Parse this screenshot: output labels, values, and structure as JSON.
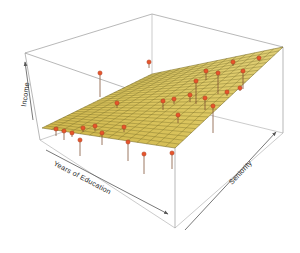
{
  "figure": {
    "name": "3d-regression-plane",
    "background_color": "#ffffff",
    "axes": {
      "vertical": {
        "label": "Income",
        "name": "income-axis"
      },
      "left_horizontal": {
        "label": "Years of Education",
        "name": "years-of-education-axis"
      },
      "right_horizontal": {
        "label": "Seniority",
        "name": "seniority-axis"
      }
    },
    "colors": {
      "plane_fill": "#d8c152",
      "plane_fill_light": "#e3d27a",
      "plane_fill_dark": "#b9a342",
      "mesh_line": "#6f6524",
      "point": "#e8542a",
      "point_stroke": "#a8361a",
      "residual_line": "#7a4a2f",
      "box_line": "#8d8d8d",
      "label_text": "#2b2b2b"
    }
  },
  "chart_data": {
    "type": "scatter",
    "title": "",
    "subtitle": "",
    "xlabel": "Years of Education",
    "ylabel": "Seniority",
    "zlabel": "Income",
    "grid": false,
    "legend_position": "none",
    "surface": {
      "name": "least-squares-regression-plane",
      "kind": "plane",
      "mesh": {
        "u_divisions": 26,
        "v_divisions": 14
      },
      "corners_screen": [
        {
          "name": "left",
          "x": 42,
          "y": 128
        },
        {
          "name": "back",
          "x": 152,
          "y": 74
        },
        {
          "name": "right",
          "x": 283,
          "y": 47
        },
        {
          "name": "front",
          "x": 175,
          "y": 148
        }
      ]
    },
    "box_corners_screen": {
      "top_back": {
        "x": 152,
        "y": 14
      },
      "top_left": {
        "x": 25,
        "y": 53
      },
      "top_right": {
        "x": 283,
        "y": 47
      },
      "top_front": {
        "x": 175,
        "y": 105
      },
      "bottom_left": {
        "x": 40,
        "y": 140
      },
      "bottom_right": {
        "x": 283,
        "y": 133
      },
      "bottom_front": {
        "x": 175,
        "y": 228
      }
    },
    "points": [
      {
        "x": 100,
        "y": 73,
        "residual": 24
      },
      {
        "x": 149,
        "y": 62,
        "residual": 6
      },
      {
        "x": 196,
        "y": 81,
        "residual": 23
      },
      {
        "x": 206,
        "y": 71,
        "residual": 9
      },
      {
        "x": 218,
        "y": 73,
        "residual": 21
      },
      {
        "x": 233,
        "y": 62,
        "residual": 4
      },
      {
        "x": 243,
        "y": 71,
        "residual": 18
      },
      {
        "x": 259,
        "y": 58,
        "residual": 3
      },
      {
        "x": 174,
        "y": 99,
        "residual": 5
      },
      {
        "x": 163,
        "y": 101,
        "residual": 9
      },
      {
        "x": 190,
        "y": 95,
        "residual": 7
      },
      {
        "x": 205,
        "y": 98,
        "residual": 12
      },
      {
        "x": 213,
        "y": 106,
        "residual": 27
      },
      {
        "x": 227,
        "y": 92,
        "residual": 4
      },
      {
        "x": 240,
        "y": 88,
        "residual": 3
      },
      {
        "x": 117,
        "y": 103,
        "residual": 5
      },
      {
        "x": 56,
        "y": 129,
        "residual": 7
      },
      {
        "x": 64,
        "y": 131,
        "residual": 9
      },
      {
        "x": 72,
        "y": 133,
        "residual": 4
      },
      {
        "x": 83,
        "y": 128,
        "residual": 4
      },
      {
        "x": 95,
        "y": 126,
        "residual": 5
      },
      {
        "x": 102,
        "y": 133,
        "residual": 12
      },
      {
        "x": 80,
        "y": 140,
        "residual": 16
      },
      {
        "x": 124,
        "y": 127,
        "residual": 5
      },
      {
        "x": 128,
        "y": 142,
        "residual": 19
      },
      {
        "x": 144,
        "y": 154,
        "residual": 20
      },
      {
        "x": 172,
        "y": 153,
        "residual": 16
      },
      {
        "x": 178,
        "y": 115,
        "residual": 8
      }
    ]
  }
}
